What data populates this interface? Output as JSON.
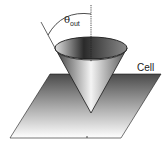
{
  "figure": {
    "type": "schematic",
    "labels": {
      "theta_symbol": "θ",
      "theta_subscript": "out",
      "cell": "Cell"
    },
    "colors": {
      "outline": "#1a1a1a",
      "plane_dark": "#555555",
      "plane_light": "#ffffff",
      "cone_dark": "#3a3a3a",
      "cone_light": "#f2f2f2"
    }
  }
}
